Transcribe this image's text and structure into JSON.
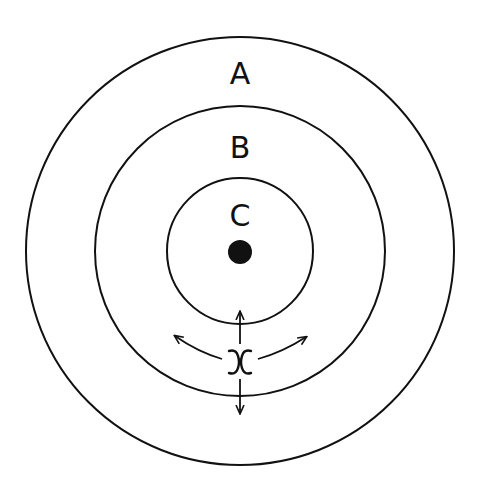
{
  "diagram": {
    "type": "concentric-circles",
    "stroke_color": "#111111",
    "background": "#ffffff",
    "center": {
      "x": 240,
      "y": 251
    },
    "circles": [
      {
        "id": "A",
        "label": "A",
        "radius": 214,
        "label_pos": {
          "x": 240,
          "y": 84
        }
      },
      {
        "id": "B",
        "label": "B",
        "radius": 145,
        "label_pos": {
          "x": 240,
          "y": 158
        }
      },
      {
        "id": "C",
        "label": "C",
        "radius": 73,
        "label_pos": {
          "x": 240,
          "y": 226
        }
      }
    ],
    "center_dot": {
      "radius": 12
    },
    "point": {
      "symbol": "x",
      "x": 240,
      "y": 362,
      "arrows": [
        "up",
        "down",
        "up-left",
        "up-right"
      ]
    }
  }
}
